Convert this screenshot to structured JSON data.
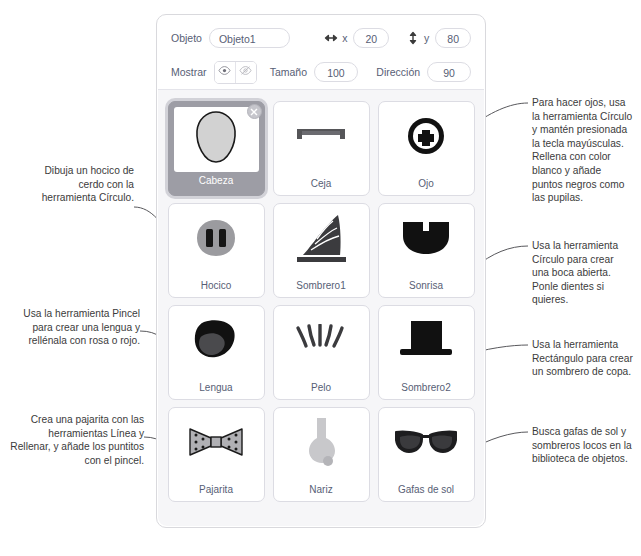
{
  "panel": {
    "info": {
      "object_label": "Objeto",
      "object_value": "Objeto1",
      "x_label": "x",
      "x_value": "20",
      "y_label": "y",
      "y_value": "80",
      "show_label": "Mostrar",
      "size_label": "Tamaño",
      "size_value": "100",
      "direction_label": "Dirección",
      "direction_value": "90"
    },
    "sprites": [
      {
        "name": "Cabeza",
        "icon": "pig-head-outline-icon",
        "selected": true
      },
      {
        "name": "Ceja",
        "icon": "eyebrow-icon",
        "selected": false
      },
      {
        "name": "Ojo",
        "icon": "eye-pixel-icon",
        "selected": false
      },
      {
        "name": "Hocico",
        "icon": "snout-icon",
        "selected": false
      },
      {
        "name": "Sombrero1",
        "icon": "witch-hat-icon",
        "selected": false
      },
      {
        "name": "Sonrisa",
        "icon": "open-mouth-icon",
        "selected": false
      },
      {
        "name": "Lengua",
        "icon": "tongue-icon",
        "selected": false
      },
      {
        "name": "Pelo",
        "icon": "hair-strands-icon",
        "selected": false
      },
      {
        "name": "Sombrero2",
        "icon": "top-hat-icon",
        "selected": false
      },
      {
        "name": "Pajarita",
        "icon": "bow-tie-icon",
        "selected": false
      },
      {
        "name": "Nariz",
        "icon": "nose-icon",
        "selected": false
      },
      {
        "name": "Gafas de sol",
        "icon": "sunglasses-icon",
        "selected": false
      }
    ]
  },
  "annotations": {
    "left": [
      {
        "id": "note-hocico",
        "text": "Dibuja un hocico de cerdo con la herramienta Círculo."
      },
      {
        "id": "note-lengua",
        "text": "Usa la herramienta Pincel para crear una lengua y rellénala con rosa o rojo."
      },
      {
        "id": "note-pajarita",
        "text": "Crea una pajarita con las herramientas Línea y Rellenar, y añade los puntitos con el pincel."
      }
    ],
    "right": [
      {
        "id": "note-ojo",
        "text": "Para hacer ojos, usa la herramienta Círculo y mantén presionada la tecla mayúsculas. Rellena con color blanco y añade puntos negros como las pupilas."
      },
      {
        "id": "note-sonrisa",
        "text": "Usa la herramienta Círculo para crear una boca abierta. Ponle dientes si quieres."
      },
      {
        "id": "note-sombrero2",
        "text": "Usa la herramienta Rectángulo para crear un sombrero de copa."
      },
      {
        "id": "note-gafas",
        "text": "Busca gafas de sol y sombreros locos en la biblioteca de objetos."
      }
    ]
  },
  "colors": {
    "panel_border": "#d9d9dd",
    "grid_bg": "#f6f6f8",
    "label_text": "#575e75",
    "note_text": "#3b3b3b",
    "selected_bg": "#9d9da5",
    "sprite_dark": "#1a1a1a",
    "sprite_gray": "#8c8c8c"
  }
}
